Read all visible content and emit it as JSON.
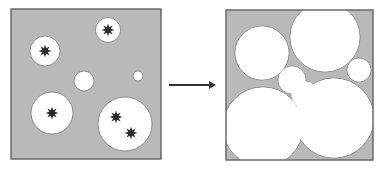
{
  "colors": {
    "background": "#ffffff",
    "panel_fill": "#b9b9b9",
    "panel_stroke": "#6a6a6a",
    "circle_fill": "#ffffff",
    "circle_stroke": "#777777",
    "star": "#2a2a2a",
    "arrow": "#333333"
  },
  "left_panel": {
    "x": 11,
    "y": 9,
    "w": 150,
    "h": 150,
    "circles": [
      {
        "cx": 45,
        "cy": 51,
        "r": 15,
        "stars": [
          [
            45,
            51
          ]
        ]
      },
      {
        "cx": 108,
        "cy": 30,
        "r": 12.5,
        "stars": [
          [
            108,
            30
          ]
        ]
      },
      {
        "cx": 84,
        "cy": 81,
        "r": 10,
        "stars": []
      },
      {
        "cx": 138,
        "cy": 76,
        "r": 5,
        "stars": []
      },
      {
        "cx": 52,
        "cy": 113,
        "r": 21,
        "stars": [
          [
            52,
            113
          ]
        ]
      },
      {
        "cx": 125,
        "cy": 124,
        "r": 27,
        "stars": [
          [
            116,
            117
          ],
          [
            131,
            133
          ]
        ]
      }
    ]
  },
  "arrow": {
    "x1": 169,
    "y1": 85,
    "x2": 216,
    "y2": 85
  },
  "right_panel": {
    "x": 226,
    "y": 10,
    "w": 147,
    "h": 150,
    "circles": [
      {
        "cx": 262,
        "cy": 53,
        "r": 27
      },
      {
        "cx": 325,
        "cy": 37,
        "r": 35
      },
      {
        "cx": 359,
        "cy": 70,
        "r": 12
      },
      {
        "cx": 263,
        "cy": 127,
        "r": 40
      },
      {
        "cx": 334,
        "cy": 118,
        "r": 40
      },
      {
        "cx": 292,
        "cy": 80,
        "r": 14
      },
      {
        "cx": 305,
        "cy": 95,
        "r": 14
      }
    ]
  }
}
